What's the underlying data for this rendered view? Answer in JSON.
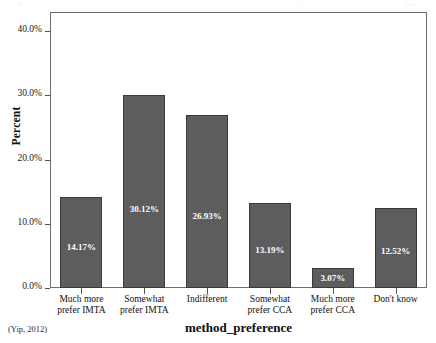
{
  "figure": {
    "source_note": "(Yip, 2012)",
    "top_clipped_fragments": [
      "⌐",
      "⌐",
      "⌐⌐"
    ]
  },
  "chart_data": {
    "type": "bar",
    "title": "",
    "xlabel": "method_preference",
    "ylabel": "Percent",
    "categories": [
      "Much more prefer IMTA",
      "Somewhat prefer IMTA",
      "Indifferent",
      "Somewhat prefer CCA",
      "Much more prefer CCA",
      "Don't know"
    ],
    "category_lines": [
      [
        "Much more",
        "prefer IMTA"
      ],
      [
        "Somewhat",
        "prefer IMTA"
      ],
      [
        "Indifferent",
        ""
      ],
      [
        "Somewhat",
        "prefer CCA"
      ],
      [
        "Much more",
        "prefer CCA"
      ],
      [
        "Don't know",
        ""
      ]
    ],
    "values": [
      14.17,
      30.12,
      26.93,
      13.19,
      3.07,
      12.52
    ],
    "data_labels": [
      "14.17%",
      "30.12%",
      "26.93%",
      "13.19%",
      "3.07%",
      "12.52%"
    ],
    "ylim": [
      0,
      43
    ],
    "yticks": [
      0,
      10,
      20,
      30,
      40
    ],
    "ytick_labels": [
      "0.0%",
      "10.0%",
      "20.0%",
      "30.0%",
      "40.0%"
    ],
    "grid": false,
    "legend": null,
    "bar_color": "#5d5d5d",
    "bar_edge_color": "#3a3a3a",
    "label_color": "#ffffff",
    "frame_color": "#6f6f6f"
  }
}
